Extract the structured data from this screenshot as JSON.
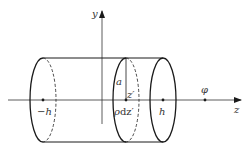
{
  "diagram": {
    "type": "cylinder-on-axis",
    "colors": {
      "stroke": "#1a1a1a",
      "axis": "#333333",
      "background": "#ffffff"
    },
    "axes": {
      "y_label": "y",
      "z_label": "z"
    },
    "points": {
      "left_end": "−h",
      "right_end": "h",
      "field_point": "φ"
    },
    "slice": {
      "radius_label": "a",
      "position_label": "z′",
      "charge_label_rho": "ρ",
      "charge_label_dz": "dz′"
    }
  }
}
